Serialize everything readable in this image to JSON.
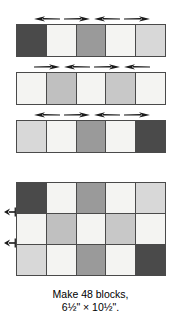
{
  "figure": {
    "name": "quilt-block-piecing-diagram",
    "caption": {
      "line1": "Make 48 blocks,",
      "line2": "6½\" × 10½\"."
    }
  },
  "palette": {
    "dark": "#4a4a4a",
    "medium": "#9a9a9a",
    "medium_light": "#c0c0c0",
    "light": "#d8d8d8",
    "white": "#f4f4f2",
    "outline": "#4a4a4a",
    "arrow": "#1a1a1a"
  },
  "strip_rows": [
    {
      "id": "strip-row-1",
      "cells": [
        {
          "fill": "#4a4a4a",
          "tone": "dark"
        },
        {
          "fill": "#f4f4f2",
          "tone": "white"
        },
        {
          "fill": "#9a9a9a",
          "tone": "medium"
        },
        {
          "fill": "#f4f4f2",
          "tone": "white"
        },
        {
          "fill": "#d8d8d8",
          "tone": "light"
        }
      ],
      "press_arrows": [
        {
          "direction": "left",
          "left": 18
        },
        {
          "direction": "right",
          "left": 48
        },
        {
          "direction": "left",
          "left": 78
        },
        {
          "direction": "right",
          "left": 108
        }
      ]
    },
    {
      "id": "strip-row-2",
      "cells": [
        {
          "fill": "#f4f4f2",
          "tone": "white"
        },
        {
          "fill": "#c0c0c0",
          "tone": "medium_light"
        },
        {
          "fill": "#f4f4f2",
          "tone": "white"
        },
        {
          "fill": "#c8c8c8",
          "tone": "light"
        },
        {
          "fill": "#f4f4f2",
          "tone": "white"
        }
      ],
      "press_arrows": [
        {
          "direction": "right",
          "left": 18
        },
        {
          "direction": "left",
          "left": 48
        },
        {
          "direction": "right",
          "left": 78
        },
        {
          "direction": "left",
          "left": 108
        }
      ]
    },
    {
      "id": "strip-row-3",
      "cells": [
        {
          "fill": "#d8d8d8",
          "tone": "light"
        },
        {
          "fill": "#f4f4f2",
          "tone": "white"
        },
        {
          "fill": "#9a9a9a",
          "tone": "medium"
        },
        {
          "fill": "#f4f4f2",
          "tone": "white"
        },
        {
          "fill": "#4a4a4a",
          "tone": "dark"
        }
      ],
      "press_arrows": [
        {
          "direction": "left",
          "left": 18
        },
        {
          "direction": "right",
          "left": 48
        },
        {
          "direction": "left",
          "left": 78
        },
        {
          "direction": "right",
          "left": 108
        }
      ]
    }
  ],
  "assembled_block": {
    "id": "assembled-block",
    "columns": 5,
    "rows": 3,
    "cells": [
      {
        "fill": "#4a4a4a",
        "tone": "dark"
      },
      {
        "fill": "#f4f4f2",
        "tone": "white"
      },
      {
        "fill": "#9a9a9a",
        "tone": "medium"
      },
      {
        "fill": "#f4f4f2",
        "tone": "white"
      },
      {
        "fill": "#d8d8d8",
        "tone": "light"
      },
      {
        "fill": "#f4f4f2",
        "tone": "white"
      },
      {
        "fill": "#c0c0c0",
        "tone": "medium_light"
      },
      {
        "fill": "#f4f4f2",
        "tone": "white"
      },
      {
        "fill": "#c8c8c8",
        "tone": "light"
      },
      {
        "fill": "#f4f4f2",
        "tone": "white"
      },
      {
        "fill": "#d8d8d8",
        "tone": "light"
      },
      {
        "fill": "#f4f4f2",
        "tone": "white"
      },
      {
        "fill": "#9a9a9a",
        "tone": "medium"
      },
      {
        "fill": "#f4f4f2",
        "tone": "white"
      },
      {
        "fill": "#4a4a4a",
        "tone": "dark"
      }
    ],
    "seam_arrows": [
      {
        "direction": "left",
        "seam": "row1-row2"
      },
      {
        "direction": "left",
        "seam": "row2-row3"
      }
    ]
  }
}
